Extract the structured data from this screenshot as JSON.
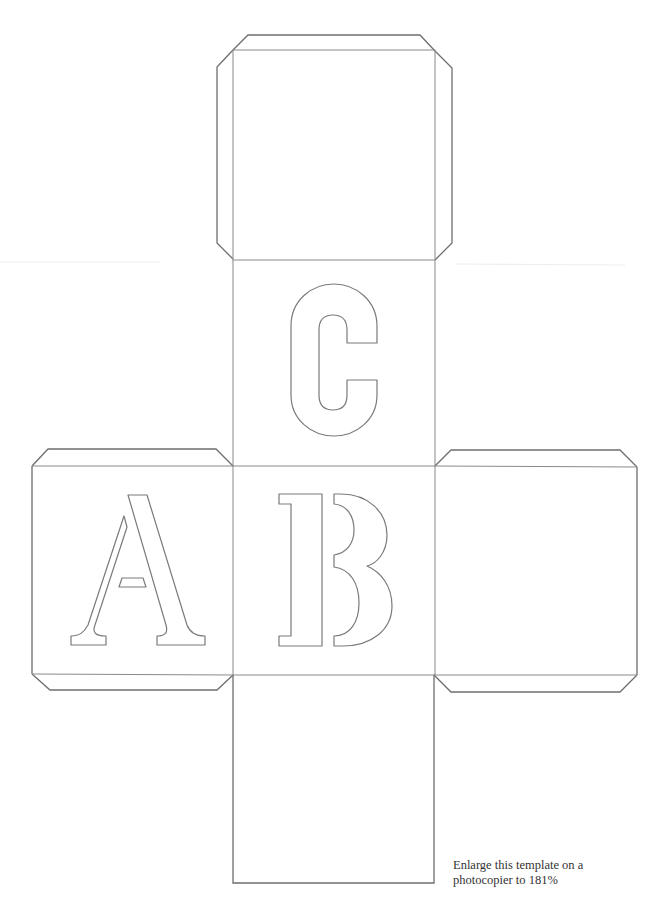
{
  "template": {
    "type": "cube-net",
    "faces": [
      {
        "position": "top",
        "letter": ""
      },
      {
        "position": "upper-middle",
        "letter": "C"
      },
      {
        "position": "left",
        "letter": "A"
      },
      {
        "position": "center",
        "letter": "B"
      },
      {
        "position": "right",
        "letter": ""
      },
      {
        "position": "bottom",
        "letter": ""
      }
    ],
    "letters": {
      "a": "A",
      "b": "B",
      "c": "C"
    },
    "line_color": "#6e6e6e",
    "background_color": "#ffffff"
  },
  "note": {
    "line1": "Enlarge this template on a",
    "line2": "photocopier to 181%"
  }
}
